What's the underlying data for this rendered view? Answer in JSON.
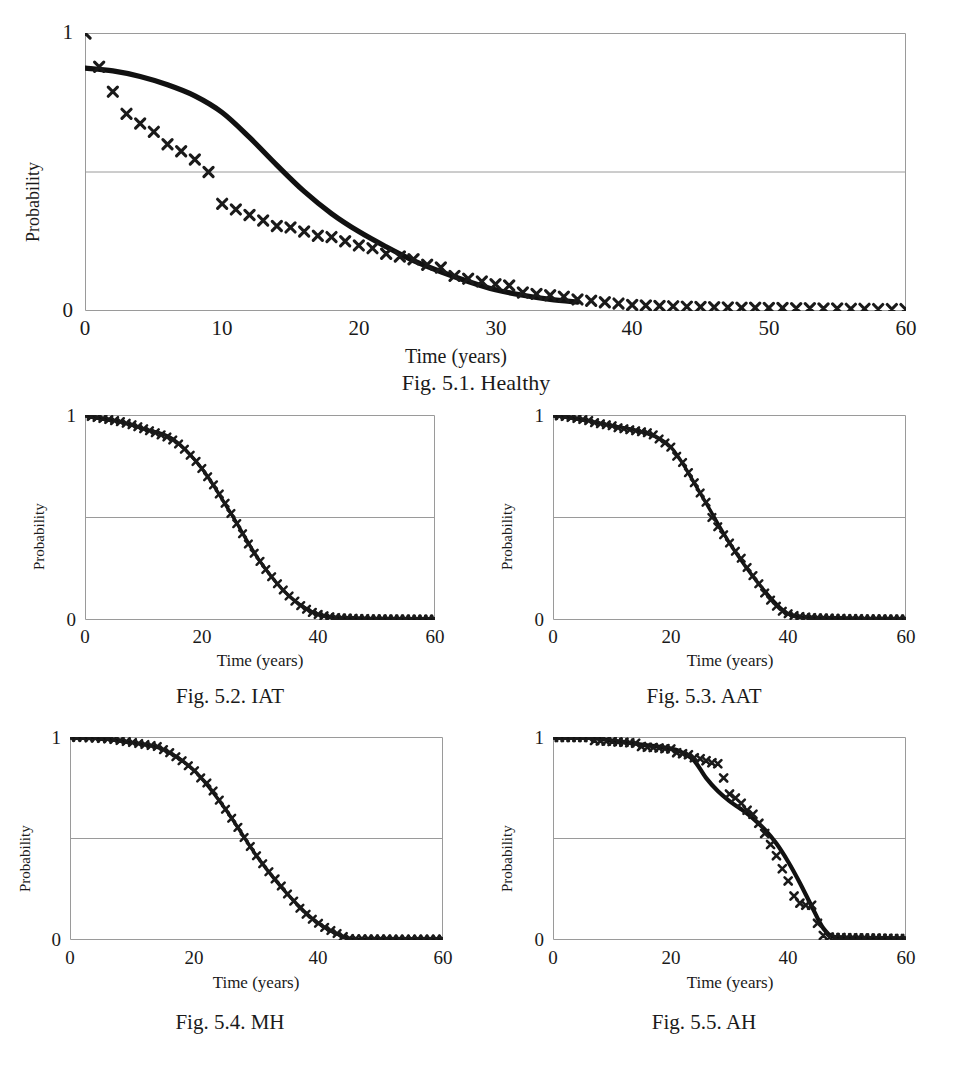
{
  "page": {
    "axis_label_x": "Time (years)",
    "axis_label_y": "Probability",
    "colors": {
      "marker": "#1a1a1a",
      "line": "#111111",
      "frame": "#9a9a9a",
      "gridline": "#9a9a9a",
      "background": "#ffffff"
    }
  },
  "figures": [
    {
      "id": "fig-5-1",
      "caption": "Fig. 5.1. Healthy",
      "xlabel": "Time (years)",
      "ylabel": "Probability",
      "xticks": [
        "0",
        "10",
        "20",
        "30",
        "40",
        "50",
        "60"
      ],
      "yticks": [
        "0",
        "1"
      ]
    },
    {
      "id": "fig-5-2",
      "caption": "Fig. 5.2. IAT",
      "xlabel": "Time (years)",
      "ylabel": "Probability",
      "xticks": [
        "0",
        "20",
        "40",
        "60"
      ],
      "yticks": [
        "0",
        "1"
      ]
    },
    {
      "id": "fig-5-3",
      "caption": "Fig. 5.3. AAT",
      "xlabel": "Time (years)",
      "ylabel": "Probability",
      "xticks": [
        "0",
        "20",
        "40",
        "60"
      ],
      "yticks": [
        "0",
        "1"
      ]
    },
    {
      "id": "fig-5-4",
      "caption": "Fig. 5.4. MH",
      "xlabel": "Time (years)",
      "ylabel": "Probability",
      "xticks": [
        "0",
        "20",
        "40",
        "60"
      ],
      "yticks": [
        "0",
        "1"
      ]
    },
    {
      "id": "fig-5-5",
      "caption": "Fig. 5.5. AH",
      "xlabel": "Time (years)",
      "ylabel": "Probability",
      "xticks": [
        "0",
        "20",
        "40",
        "60"
      ],
      "yticks": [
        "0",
        "1"
      ]
    }
  ],
  "chart_data": [
    {
      "type": "line",
      "id": "fig-5-1",
      "title": "Fig. 5.1. Healthy",
      "xlabel": "Time (years)",
      "ylabel": "Probability",
      "xlim": [
        0,
        60
      ],
      "ylim": [
        0,
        1
      ],
      "xticks": [
        0,
        10,
        20,
        30,
        40,
        50,
        60
      ],
      "yticks": [
        0,
        1
      ],
      "grid": "horizontal gridlines at y=0.5 and y=1",
      "legend": "none",
      "series": [
        {
          "name": "Observed (x markers)",
          "marker": "x",
          "x": [
            0,
            1,
            2,
            3,
            4,
            5,
            6,
            7,
            8,
            9,
            10,
            11,
            12,
            13,
            14,
            15,
            16,
            17,
            18,
            19,
            20,
            21,
            22,
            23,
            24,
            25,
            26,
            27,
            28,
            29,
            30,
            31,
            32,
            33,
            34,
            35,
            36,
            37,
            38,
            39,
            40,
            41,
            42,
            43,
            44,
            45,
            46,
            47,
            48,
            49,
            50,
            51,
            52,
            53,
            54,
            55,
            56,
            57,
            58,
            59,
            60
          ],
          "y": [
            1.0,
            0.88,
            0.79,
            0.71,
            0.675,
            0.645,
            0.6,
            0.575,
            0.545,
            0.5,
            0.385,
            0.365,
            0.345,
            0.325,
            0.305,
            0.3,
            0.285,
            0.27,
            0.265,
            0.25,
            0.235,
            0.225,
            0.205,
            0.195,
            0.185,
            0.165,
            0.155,
            0.125,
            0.115,
            0.105,
            0.095,
            0.09,
            0.065,
            0.06,
            0.055,
            0.05,
            0.04,
            0.035,
            0.03,
            0.025,
            0.02,
            0.018,
            0.016,
            0.015,
            0.014,
            0.013,
            0.012,
            0.011,
            0.01,
            0.01,
            0.009,
            0.009,
            0.008,
            0.008,
            0.007,
            0.007,
            0.006,
            0.006,
            0.005,
            0.005,
            0.005
          ]
        },
        {
          "name": "Fitted (solid line)",
          "marker": "none",
          "x": [
            0,
            2,
            4,
            6,
            8,
            10,
            12,
            14,
            16,
            18,
            20,
            22,
            24,
            26,
            28,
            30,
            32,
            34,
            36
          ],
          "y": [
            0.875,
            0.865,
            0.845,
            0.815,
            0.775,
            0.715,
            0.625,
            0.525,
            0.43,
            0.35,
            0.285,
            0.23,
            0.18,
            0.14,
            0.105,
            0.075,
            0.055,
            0.04,
            0.03
          ]
        }
      ]
    },
    {
      "type": "line",
      "id": "fig-5-2",
      "title": "Fig. 5.2. IAT",
      "xlabel": "Time (years)",
      "ylabel": "Probability",
      "xlim": [
        0,
        60
      ],
      "ylim": [
        0,
        1
      ],
      "xticks": [
        0,
        20,
        40,
        60
      ],
      "yticks": [
        0,
        1
      ],
      "grid": "horizontal gridlines at y=0.5 and y=1",
      "legend": "none",
      "series": [
        {
          "name": "Observed (x markers)",
          "marker": "x",
          "x": [
            0,
            1,
            2,
            3,
            4,
            5,
            6,
            7,
            8,
            9,
            10,
            11,
            12,
            13,
            14,
            15,
            16,
            17,
            18,
            19,
            20,
            21,
            22,
            23,
            24,
            25,
            26,
            27,
            28,
            29,
            30,
            31,
            32,
            33,
            34,
            35,
            36,
            37,
            38,
            39,
            40,
            41,
            42,
            43,
            44,
            45,
            46,
            47,
            48,
            49,
            50,
            51,
            52,
            53,
            54,
            55,
            56,
            57,
            58,
            59,
            60
          ],
          "y": [
            1.0,
            0.995,
            0.99,
            0.985,
            0.98,
            0.975,
            0.97,
            0.962,
            0.955,
            0.945,
            0.935,
            0.925,
            0.915,
            0.905,
            0.895,
            0.88,
            0.86,
            0.835,
            0.805,
            0.775,
            0.74,
            0.7,
            0.66,
            0.615,
            0.57,
            0.52,
            0.47,
            0.42,
            0.37,
            0.325,
            0.285,
            0.245,
            0.21,
            0.175,
            0.145,
            0.115,
            0.09,
            0.068,
            0.05,
            0.035,
            0.025,
            0.018,
            0.013,
            0.01,
            0.008,
            0.007,
            0.006,
            0.005,
            0.005,
            0.004,
            0.004,
            0.004,
            0.003,
            0.003,
            0.003,
            0.003,
            0.002,
            0.002,
            0.002,
            0.002,
            0.002
          ]
        },
        {
          "name": "Fitted (solid line)",
          "marker": "none",
          "x": [
            0,
            5,
            10,
            15,
            20,
            25,
            30,
            35,
            40,
            45,
            50,
            55,
            60
          ],
          "y": [
            1.0,
            0.975,
            0.935,
            0.885,
            0.74,
            0.52,
            0.285,
            0.115,
            0.025,
            0.007,
            0.004,
            0.003,
            0.002
          ]
        }
      ]
    },
    {
      "type": "line",
      "id": "fig-5-3",
      "title": "Fig. 5.3. AAT",
      "xlabel": "Time (years)",
      "ylabel": "Probability",
      "xlim": [
        0,
        60
      ],
      "ylim": [
        0,
        1
      ],
      "xticks": [
        0,
        20,
        40,
        60
      ],
      "yticks": [
        0,
        1
      ],
      "grid": "horizontal gridlines at y=0.5 and y=1",
      "legend": "none",
      "series": [
        {
          "name": "Observed (x markers)",
          "marker": "x",
          "x": [
            0,
            1,
            2,
            3,
            4,
            5,
            6,
            7,
            8,
            9,
            10,
            11,
            12,
            13,
            14,
            15,
            16,
            17,
            18,
            19,
            20,
            21,
            22,
            23,
            24,
            25,
            26,
            27,
            28,
            29,
            30,
            31,
            32,
            33,
            34,
            35,
            36,
            37,
            38,
            39,
            40,
            41,
            42,
            43,
            44,
            45,
            46,
            47,
            48,
            49,
            50,
            51,
            52,
            53,
            54,
            55,
            56,
            57,
            58,
            59,
            60
          ],
          "y": [
            1.0,
            0.998,
            0.995,
            0.99,
            0.985,
            0.98,
            0.975,
            0.965,
            0.96,
            0.955,
            0.95,
            0.94,
            0.935,
            0.93,
            0.925,
            0.92,
            0.915,
            0.905,
            0.885,
            0.865,
            0.845,
            0.8,
            0.77,
            0.72,
            0.67,
            0.62,
            0.575,
            0.5,
            0.455,
            0.415,
            0.375,
            0.335,
            0.3,
            0.255,
            0.215,
            0.175,
            0.13,
            0.095,
            0.065,
            0.04,
            0.028,
            0.02,
            0.015,
            0.012,
            0.01,
            0.009,
            0.008,
            0.007,
            0.006,
            0.006,
            0.005,
            0.005,
            0.005,
            0.004,
            0.004,
            0.004,
            0.004,
            0.003,
            0.003,
            0.003,
            0.003
          ]
        },
        {
          "name": "Fitted (solid line)",
          "marker": "none",
          "x": [
            0,
            5,
            10,
            15,
            20,
            25,
            30,
            35,
            40,
            45,
            50,
            55,
            60
          ],
          "y": [
            1.0,
            0.98,
            0.95,
            0.92,
            0.845,
            0.62,
            0.375,
            0.175,
            0.028,
            0.009,
            0.005,
            0.004,
            0.003
          ]
        }
      ]
    },
    {
      "type": "line",
      "id": "fig-5-4",
      "title": "Fig. 5.4. MH",
      "xlabel": "Time (years)",
      "ylabel": "Probability",
      "xlim": [
        0,
        60
      ],
      "ylim": [
        0,
        1
      ],
      "xticks": [
        0,
        20,
        40,
        60
      ],
      "yticks": [
        0,
        1
      ],
      "grid": "horizontal gridlines at y=0.5 and y=1",
      "legend": "none",
      "series": [
        {
          "name": "Observed (x markers)",
          "marker": "x",
          "x": [
            0,
            1,
            2,
            3,
            4,
            5,
            6,
            7,
            8,
            9,
            10,
            11,
            12,
            13,
            14,
            15,
            16,
            17,
            18,
            19,
            20,
            21,
            22,
            23,
            24,
            25,
            26,
            27,
            28,
            29,
            30,
            31,
            32,
            33,
            34,
            35,
            36,
            37,
            38,
            39,
            40,
            41,
            42,
            43,
            44,
            45,
            46,
            47,
            48,
            49,
            50,
            51,
            52,
            53,
            54,
            55,
            56,
            57,
            58,
            59,
            60
          ],
          "y": [
            1.0,
            1.0,
            1.0,
            0.998,
            0.997,
            0.995,
            0.993,
            0.99,
            0.985,
            0.98,
            0.975,
            0.97,
            0.965,
            0.96,
            0.955,
            0.94,
            0.925,
            0.905,
            0.885,
            0.86,
            0.835,
            0.8,
            0.775,
            0.735,
            0.69,
            0.645,
            0.6,
            0.555,
            0.505,
            0.46,
            0.415,
            0.375,
            0.335,
            0.3,
            0.265,
            0.225,
            0.19,
            0.155,
            0.125,
            0.1,
            0.08,
            0.06,
            0.045,
            0.03,
            0.015,
            0.005,
            0.004,
            0.004,
            0.003,
            0.003,
            0.003,
            0.003,
            0.002,
            0.002,
            0.002,
            0.002,
            0.002,
            0.002,
            0.002,
            0.002,
            0.002
          ]
        },
        {
          "name": "Fitted (solid line)",
          "marker": "none",
          "x": [
            0,
            5,
            10,
            15,
            20,
            25,
            30,
            35,
            40,
            45,
            50,
            55,
            60
          ],
          "y": [
            1.0,
            0.995,
            0.975,
            0.94,
            0.835,
            0.645,
            0.415,
            0.225,
            0.08,
            0.005,
            0.003,
            0.002,
            0.002
          ]
        }
      ]
    },
    {
      "type": "line",
      "id": "fig-5-5",
      "title": "Fig. 5.5. AH",
      "xlabel": "Time (years)",
      "ylabel": "Probability",
      "xlim": [
        0,
        60
      ],
      "ylim": [
        0,
        1
      ],
      "xticks": [
        0,
        20,
        40,
        60
      ],
      "yticks": [
        0,
        1
      ],
      "grid": "horizontal gridlines at y=0.5 and y=1",
      "legend": "none",
      "series": [
        {
          "name": "Observed (x markers)",
          "marker": "x",
          "x": [
            0,
            1,
            2,
            3,
            4,
            5,
            6,
            7,
            8,
            9,
            10,
            11,
            12,
            13,
            14,
            15,
            16,
            17,
            18,
            19,
            20,
            21,
            22,
            23,
            24,
            25,
            26,
            27,
            28,
            29,
            30,
            31,
            32,
            33,
            34,
            35,
            36,
            37,
            38,
            39,
            40,
            41,
            42,
            43,
            44,
            45,
            46,
            47,
            48,
            49,
            50,
            51,
            52,
            53,
            54,
            55,
            56,
            57,
            58,
            59,
            60
          ],
          "y": [
            1.0,
            1.0,
            1.0,
            1.0,
            1.0,
            1.0,
            1.0,
            0.985,
            0.983,
            0.982,
            0.98,
            0.978,
            0.976,
            0.974,
            0.972,
            0.955,
            0.952,
            0.95,
            0.948,
            0.945,
            0.943,
            0.925,
            0.92,
            0.915,
            0.9,
            0.895,
            0.885,
            0.875,
            0.87,
            0.8,
            0.72,
            0.7,
            0.675,
            0.64,
            0.62,
            0.575,
            0.525,
            0.47,
            0.415,
            0.35,
            0.29,
            0.215,
            0.18,
            0.17,
            0.17,
            0.08,
            0.02,
            0.012,
            0.01,
            0.01,
            0.009,
            0.009,
            0.008,
            0.008,
            0.007,
            0.007,
            0.006,
            0.006,
            0.005,
            0.005,
            0.005
          ]
        },
        {
          "name": "Fitted (solid line)",
          "marker": "none",
          "x": [
            0,
            5,
            10,
            15,
            20,
            22,
            24,
            26,
            28,
            30,
            32,
            34,
            36,
            38,
            40,
            42,
            44,
            46,
            48,
            52,
            56,
            60
          ],
          "y": [
            1.0,
            1.0,
            0.985,
            0.965,
            0.945,
            0.925,
            0.885,
            0.8,
            0.735,
            0.685,
            0.645,
            0.6,
            0.545,
            0.475,
            0.385,
            0.28,
            0.165,
            0.055,
            0.012,
            0.008,
            0.006,
            0.005
          ]
        }
      ]
    }
  ]
}
